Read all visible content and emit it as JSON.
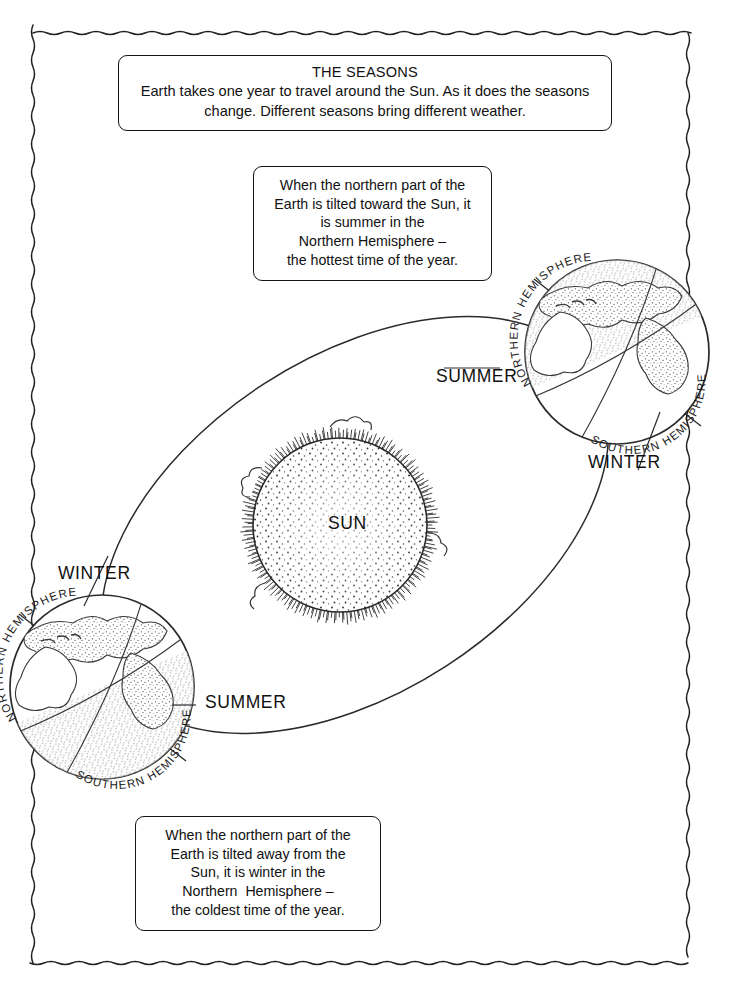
{
  "worksheet": {
    "title_box": {
      "heading": "THE SEASONS",
      "lines": [
        "Earth takes one year to travel around the Sun. As it does the seasons",
        "change. Different seasons bring different weather."
      ]
    },
    "captions": [
      {
        "id": "summer-caption",
        "lines": [
          "When the northern part of the",
          "Earth is tilted toward the Sun, it",
          "is summer in the",
          "Northern Hemisphere –",
          "the hottest time of the year."
        ]
      },
      {
        "id": "winter-caption",
        "lines": [
          "When the northern part of the",
          "Earth is tilted away from the",
          "Sun, it is winter in the",
          "Northern  Hemisphere –",
          "the coldest time of the year."
        ]
      }
    ],
    "sun": {
      "label": "SUN"
    },
    "globes": [
      {
        "id": "globe-right",
        "position": "upper-right",
        "northern_label": "NORTHERN HEMISPHERE",
        "southern_label": "SOUTHERN HEMISPHERE",
        "season_near_label": "SUMMER",
        "season_far_label": "WINTER",
        "shaded_hemisphere": "northern",
        "tilt_note": "northern part tilted toward the Sun"
      },
      {
        "id": "globe-left",
        "position": "lower-left",
        "northern_label": "NORTHERN HEMISPHERE",
        "southern_label": "SOUTHERN HEMISPHERE",
        "season_near_label": "WINTER",
        "season_far_label": "SUMMER",
        "shaded_hemisphere": "southern",
        "tilt_note": "northern part tilted away from the Sun"
      }
    ],
    "season_labels": {
      "summer_right": "SUMMER",
      "winter_right": "WINTER",
      "winter_left": "WINTER",
      "summer_left": "SUMMER"
    },
    "colors": {
      "ink": "#141414",
      "paper": "#ffffff",
      "shade": "#8d8d8d"
    }
  }
}
